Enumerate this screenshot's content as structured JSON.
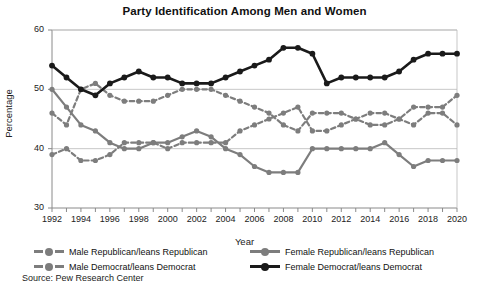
{
  "chart_data": {
    "type": "line",
    "title": "Party Identification Among Men and Women",
    "xlabel": "Year",
    "ylabel": "Percentage",
    "ylim": [
      30,
      60
    ],
    "yticks": [
      30,
      40,
      50,
      60
    ],
    "xlim": [
      1992,
      2020
    ],
    "xticks": [
      1992,
      1994,
      1996,
      1998,
      2000,
      2002,
      2004,
      2006,
      2008,
      2010,
      2012,
      2014,
      2016,
      2018,
      2020
    ],
    "minor_x_step": 1,
    "grid": "horizontal",
    "legend_position": "below",
    "source": "Source: Pew Research Center",
    "x": [
      1992,
      1993,
      1994,
      1995,
      1996,
      1997,
      1998,
      1999,
      2000,
      2001,
      2002,
      2003,
      2004,
      2005,
      2006,
      2007,
      2008,
      2009,
      2010,
      2011,
      2012,
      2013,
      2014,
      2015,
      2016,
      2017,
      2018,
      2019,
      2020
    ],
    "series": [
      {
        "name": "Male Republican/leans Republican",
        "color": "#7d7d7d",
        "style": "dashed",
        "marker": "circle",
        "values": [
          46,
          44,
          50,
          51,
          49,
          48,
          48,
          48,
          49,
          50,
          50,
          50,
          49,
          48,
          47,
          46,
          44,
          43,
          46,
          46,
          46,
          45,
          46,
          46,
          45,
          44,
          46,
          46,
          44
        ]
      },
      {
        "name": "Male Democrat/leans Democrat",
        "color": "#7d7d7d",
        "style": "dashed",
        "marker": "circle",
        "values": [
          39,
          40,
          38,
          38,
          39,
          41,
          41,
          41,
          40,
          41,
          41,
          41,
          41,
          43,
          44,
          45,
          46,
          47,
          43,
          43,
          44,
          45,
          44,
          44,
          45,
          47,
          47,
          47,
          49
        ]
      },
      {
        "name": "Female Republican/leans Republican",
        "color": "#7d7d7d",
        "style": "solid",
        "marker": "circle",
        "values": [
          50,
          47,
          44,
          43,
          41,
          40,
          40,
          41,
          41,
          42,
          43,
          42,
          40,
          39,
          37,
          36,
          36,
          36,
          40,
          40,
          40,
          40,
          40,
          41,
          39,
          37,
          38,
          38,
          38
        ]
      },
      {
        "name": "Female Democrat/leans Democrat",
        "color": "#1a1a1a",
        "style": "solid",
        "marker": "circle",
        "values": [
          54,
          52,
          50,
          49,
          51,
          52,
          53,
          52,
          52,
          51,
          51,
          51,
          52,
          53,
          54,
          55,
          57,
          57,
          56,
          51,
          52,
          52,
          52,
          52,
          53,
          55,
          56,
          56,
          56
        ]
      }
    ]
  }
}
